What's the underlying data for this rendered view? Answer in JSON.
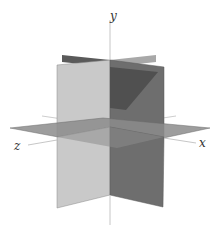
{
  "figure": {
    "axes": {
      "x_label": "x",
      "y_label": "y",
      "z_label": "z"
    },
    "colors": {
      "background": "#ffffff",
      "axis_line": "#b8b8b8",
      "label": "#333333",
      "front_left_plane": "#c9c9c9",
      "front_right_plane": "#6e6e6e",
      "back_left_plane": "#5a5a5a",
      "back_right_plane": "#a8a8a8",
      "horizontal_plane": "#8c8c8c",
      "shadow": "#505050",
      "edge": "#7a7a7a"
    }
  }
}
